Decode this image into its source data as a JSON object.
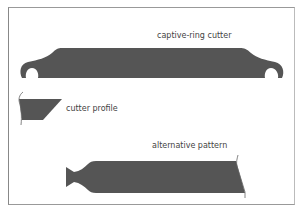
{
  "figure": {
    "labels": {
      "captive_ring_cutter": "captive-ring cutter",
      "cutter_profile": "cutter profile",
      "alternative_pattern": "alternative pattern"
    },
    "colors": {
      "fill": "#555555",
      "frame": "#999999",
      "background": "#ffffff",
      "text": "#444444"
    }
  }
}
